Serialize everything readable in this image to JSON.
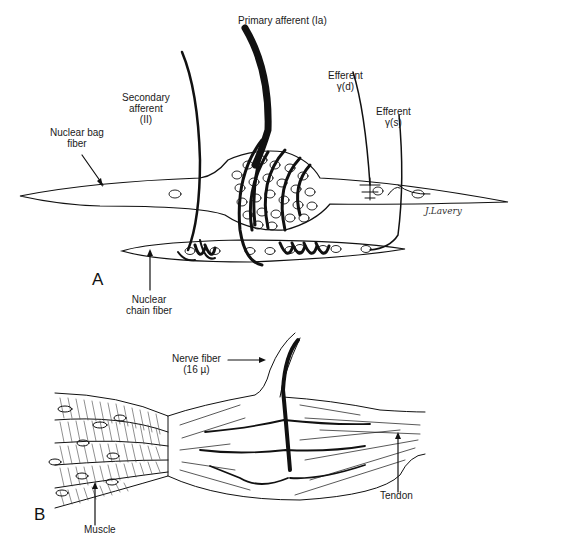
{
  "figure": {
    "panel_a": {
      "letter": "A",
      "labels": {
        "primary_afferent": "Primary afferent (Ia)",
        "secondary_afferent_1": "Secondary",
        "secondary_afferent_2": "afferent",
        "secondary_afferent_3": "(II)",
        "nuclear_bag_1": "Nuclear bag",
        "nuclear_bag_2": "fiber",
        "efferent_d_1": "Efferent",
        "efferent_d_2": "γ(d)",
        "efferent_s_1": "Efferent",
        "efferent_s_2": "γ(s)",
        "nuclear_chain_1": "Nuclear",
        "nuclear_chain_2": "chain fiber"
      },
      "signature": "J.Lavery"
    },
    "panel_b": {
      "letter": "B",
      "labels": {
        "nerve_fiber_1": "Nerve fiber",
        "nerve_fiber_2": "(16 µ)",
        "tendon": "Tendon",
        "muscle": "Muscle"
      }
    },
    "colors": {
      "ink": "#111111",
      "background": "#ffffff"
    }
  }
}
